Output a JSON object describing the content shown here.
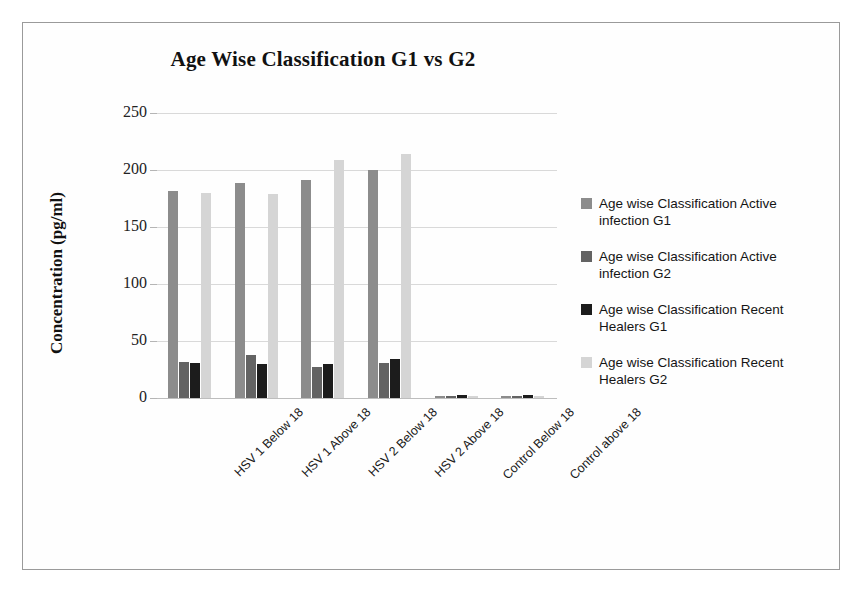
{
  "chart_data": {
    "type": "bar",
    "title": "Age Wise Classification G1 vs G2",
    "xlabel": "",
    "ylabel": "Concentration (pg/ml)",
    "ylim": [
      0,
      250
    ],
    "yticks": [
      0,
      50,
      100,
      150,
      200,
      250
    ],
    "grid": true,
    "legend_position": "right",
    "categories": [
      "HSV 1 Below 18",
      "HSV 1 Above 18",
      "HSV 2 Below 18",
      "HSV 2 Above 18",
      "Control Below 18",
      "Control above 18"
    ],
    "series": [
      {
        "name": "Age wise Classification Active infection G1",
        "color": "#8c8c8c",
        "values": [
          182,
          189,
          191,
          200,
          2,
          2
        ]
      },
      {
        "name": "Age wise Classification Active infection G2",
        "color": "#636363",
        "values": [
          32,
          38,
          27,
          31,
          2,
          2
        ]
      },
      {
        "name": "Age wise Classification Recent Healers G1",
        "color": "#1c1c1c",
        "values": [
          31,
          30,
          30,
          34,
          3,
          3
        ]
      },
      {
        "name": "Age wise Classification Recent Healers G2",
        "color": "#d5d5d5",
        "values": [
          180,
          179,
          209,
          214,
          2,
          2
        ]
      }
    ]
  },
  "legend": {
    "items": [
      {
        "label": "Age wise Classification Active infection G1",
        "color": "#8c8c8c"
      },
      {
        "label": "Age wise Classification Active infection G2",
        "color": "#636363"
      },
      {
        "label": "Age wise Classification Recent Healers G1",
        "color": "#1c1c1c"
      },
      {
        "label": "Age wise Classification Recent Healers G2",
        "color": "#d5d5d5"
      }
    ]
  }
}
